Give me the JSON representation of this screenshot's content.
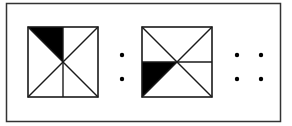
{
  "figure": {
    "frame": {
      "x": 6,
      "y": 3,
      "width": 274,
      "height": 118,
      "stroke": "#333333"
    },
    "colors": {
      "stroke": "#1a1a1a",
      "fill_shaded": "#000000",
      "background": "#ffffff"
    },
    "panels": [
      {
        "name": "square-1",
        "x": 28,
        "y": 27,
        "size": 70,
        "divider": "vertical",
        "shaded_region": "top-left triangle between left diagonal and vertical midline (upper half)"
      },
      {
        "name": "square-2",
        "x": 142,
        "y": 27,
        "size": 70,
        "divider": "horizontal",
        "shaded_region": "left triangle below horizontal midline, above anti-diagonal"
      }
    ],
    "dot_groups": [
      {
        "name": "colon-dots",
        "dots": [
          [
            122,
            55
          ],
          [
            122,
            79
          ]
        ]
      },
      {
        "name": "four-dots",
        "dots": [
          [
            237,
            55
          ],
          [
            261,
            55
          ],
          [
            237,
            79
          ],
          [
            261,
            79
          ]
        ]
      }
    ]
  }
}
